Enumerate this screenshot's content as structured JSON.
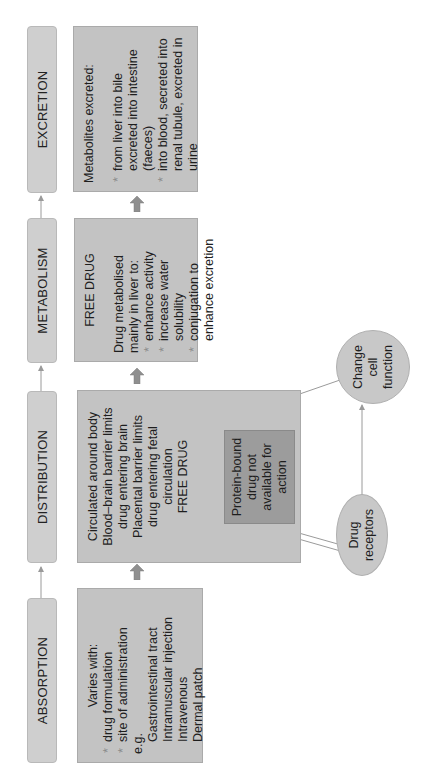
{
  "stages": [
    {
      "label": "ABSORPTION"
    },
    {
      "label": "DISTRIBUTION"
    },
    {
      "label": "METABOLISM"
    },
    {
      "label": "EXCRETION"
    }
  ],
  "absorption": {
    "intro": "Varies with:",
    "bullets": [
      "drug formulation",
      "site of administration"
    ],
    "eg": "e.g.",
    "examples": [
      "Gastrointestinal tract",
      "Intramuscular injection",
      "Intravenous",
      "Dermal patch"
    ]
  },
  "distribution": {
    "lines": [
      "Circulated around body",
      "Blood–brain barrier limits",
      "drug entering brain",
      "Placental barrier limits",
      "drug entering fetal",
      "circulation",
      "FREE DRUG"
    ]
  },
  "protein_bound": {
    "text": "Protein-bound drug not available for action"
  },
  "metabolism": {
    "title": "FREE DRUG",
    "intro1": "Drug metabolised",
    "intro2": "mainly in liver to:",
    "bullets": [
      "enhance activity",
      "increase water solubility",
      "conjugation to enhance excretion"
    ]
  },
  "excretion": {
    "intro": "Metabolites excreted:",
    "bullets": [
      "from liver into bile excreted into intestine (faeces)",
      "into blood, secreted into renal tubule, excreted in urine"
    ]
  },
  "drug_receptors": {
    "text": "Drug receptors"
  },
  "change_cell_function": {
    "text": "Change cell function"
  },
  "colors": {
    "header_fill": "#cfcfcf",
    "box_fill": "#c3c3c3",
    "protein_box_fill": "#9c9c9c",
    "arrow_fill": "#8f8f8f",
    "line": "#9a9a9a"
  }
}
